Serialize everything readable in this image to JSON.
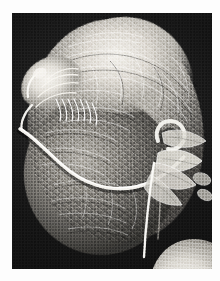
{
  "document": {
    "type": "scientific-micrograph-plate",
    "background_color": "#fdfdfd"
  },
  "figure": {
    "name": "sem-micrograph",
    "alt_description": "Scanning electron micrograph of a mite-like arthropod showing a rounded, wrinkled body with a bright curved filament across it and appendages at the right",
    "modality": "scanning-electron-microscopy",
    "rendering": "grayscale",
    "plate": {
      "x": 12,
      "y": 13,
      "width": 200,
      "height": 256,
      "background_color": "#0d0d0d"
    },
    "tones": {
      "background_dark": "#0d0d0d",
      "body_midtone": "#8e8b85",
      "highlight": "#f3f1ec",
      "shadow": "#353431",
      "page_white": "#fdfdfd"
    },
    "features": [
      {
        "name": "body-main",
        "label": "rounded dorsal body (idiosoma)"
      },
      {
        "name": "body-lower",
        "label": "lower ventral lobe"
      },
      {
        "name": "dorsal-cap",
        "label": "illuminated dorsal surface"
      },
      {
        "name": "capitulum",
        "label": "head / capitulum with hooks"
      },
      {
        "name": "bristles",
        "label": "bristle comb on palps"
      },
      {
        "name": "filament-band",
        "label": "bright curved filament crossing body"
      },
      {
        "name": "appendages",
        "label": "right-side leaf-like appendages"
      },
      {
        "name": "trailing-filament",
        "label": "thin filament descending to lower edge"
      },
      {
        "name": "bottom-object",
        "label": "bright rounded object at lower right"
      }
    ]
  }
}
